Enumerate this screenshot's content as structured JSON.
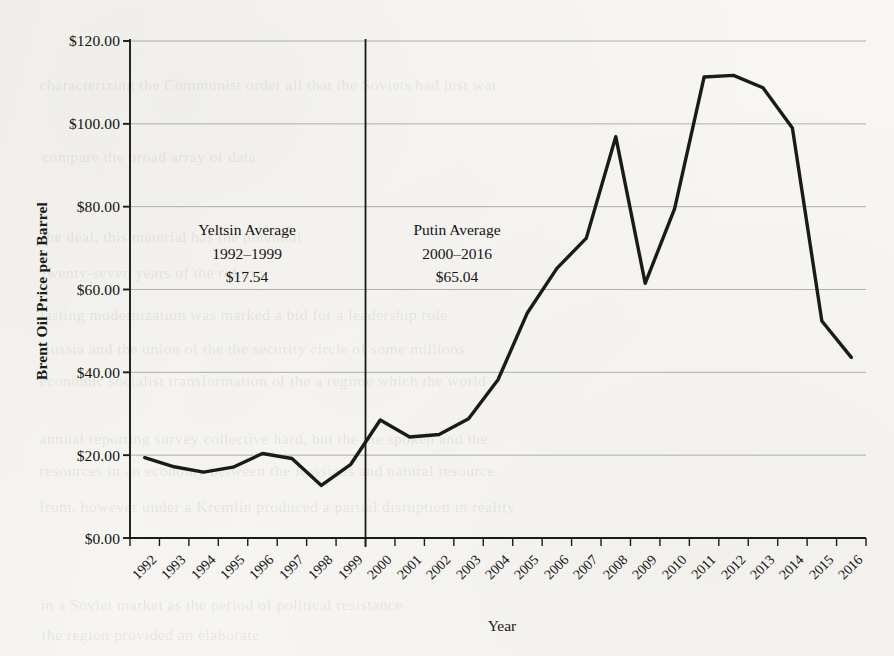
{
  "chart_data": {
    "type": "line",
    "title": "",
    "xlabel": "Year",
    "ylabel": "Brent Oil Price per Barrel",
    "ylim": [
      0,
      120
    ],
    "ytick_labels": [
      "$120.00",
      "$100.00",
      "$80.00",
      "$60.00",
      "$40.00",
      "$20.00",
      "$0.00"
    ],
    "ytick_values": [
      120,
      100,
      80,
      60,
      40,
      20,
      0
    ],
    "grid": true,
    "legend": "none",
    "categories": [
      "1992",
      "1993",
      "1994",
      "1995",
      "1996",
      "1997",
      "1998",
      "1999",
      "2000",
      "2001",
      "2002",
      "2003",
      "2004",
      "2005",
      "2006",
      "2007",
      "2008",
      "2009",
      "2010",
      "2011",
      "2012",
      "2013",
      "2014",
      "2015",
      "2016"
    ],
    "x": [
      1992,
      1993,
      1994,
      1995,
      1996,
      1997,
      1998,
      1999,
      2000,
      2001,
      2002,
      2003,
      2004,
      2005,
      2006,
      2007,
      2008,
      2009,
      2010,
      2011,
      2012,
      2013,
      2014,
      2015,
      2016
    ],
    "values": [
      19.4,
      17.2,
      15.9,
      17.1,
      20.4,
      19.2,
      12.7,
      17.8,
      28.5,
      24.4,
      25.0,
      28.8,
      38.2,
      54.4,
      65.1,
      72.4,
      96.9,
      61.5,
      79.5,
      111.3,
      111.7,
      108.7,
      99.0,
      52.4,
      43.6
    ],
    "annotations": [
      {
        "id": "yeltsin",
        "lines": [
          "Yeltsin Average",
          "1992–1999",
          "$17.54"
        ],
        "period_label": "Yeltsin Average",
        "period_years": "1992–1999",
        "period_average": "$17.54"
      },
      {
        "id": "putin",
        "lines": [
          "Putin Average",
          "2000–2016",
          "$65.04"
        ],
        "period_label": "Putin Average",
        "period_years": "2000–2016",
        "period_average": "$65.04"
      }
    ],
    "divider": {
      "between": "1999/2000",
      "x_value": 1999.5
    },
    "colors": {
      "series_line": "#1a1a1a",
      "axis": "#1a1a1a",
      "gridline": "#9a9a96",
      "background": "#f7f6f2",
      "text": "#121212"
    }
  },
  "ghost_text": [
    {
      "text": "characterizing the Communist order  all that the Soviets had just war",
      "x": 44,
      "y": 76
    },
    {
      "text": "compare the broad array of data",
      "x": 44,
      "y": 148
    },
    {
      "text": "the deal, this material has the potential",
      "x": 44,
      "y": 228
    },
    {
      "text": "twenty-seven years of the reform",
      "x": 44,
      "y": 264
    },
    {
      "text": "lasting modernization was marked a bid for a leadership role",
      "x": 44,
      "y": 306
    },
    {
      "text": "Russia and the union of the the security circle of some millions",
      "x": 44,
      "y": 340
    },
    {
      "text": "economic socialist transformation of the  a regime which the world",
      "x": 44,
      "y": 372
    },
    {
      "text": "annual reporting survey collective hard, but the  the spoken and the",
      "x": 44,
      "y": 430
    },
    {
      "text": "resources in an economy between the Russians and  natural resource",
      "x": 44,
      "y": 462
    },
    {
      "text": "from, however under a  Kremlin produced a partial disruption in reality",
      "x": 44,
      "y": 498
    },
    {
      "text": "in a Soviet market as the period of political resistance",
      "x": 44,
      "y": 596
    },
    {
      "text": "the region provided an elaborate",
      "x": 44,
      "y": 626
    }
  ]
}
